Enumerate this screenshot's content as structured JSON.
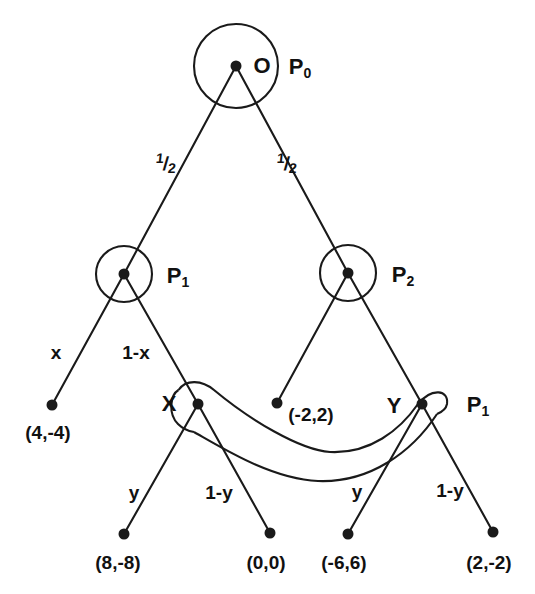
{
  "diagram": {
    "background": "#ffffff",
    "ink": "#1a1a1a",
    "width": 535,
    "height": 594
  },
  "nodes": {
    "root": {
      "label": "O",
      "player": "P",
      "player_sub": "0",
      "x": 236,
      "y": 66,
      "ring_r": 42
    },
    "p1_left": {
      "label": "",
      "player": "P",
      "player_sub": "1",
      "x": 124,
      "y": 274,
      "ring_r": 28
    },
    "p2_right": {
      "label": "",
      "player": "P",
      "player_sub": "2",
      "x": 348,
      "y": 273,
      "ring_r": 28
    },
    "x_node": {
      "label": "X",
      "player": "",
      "player_sub": "",
      "x": 198,
      "y": 404,
      "ring_r": 21
    },
    "y_node": {
      "label": "Y",
      "player": "P",
      "player_sub": "1",
      "x": 422,
      "y": 404,
      "ring_r": 21
    }
  },
  "leaves": [
    {
      "name": "leaf-4-minus4",
      "payoff": "(4,-4)",
      "x": 52,
      "y": 405,
      "label_x": 48,
      "label_y": 432
    },
    {
      "name": "leaf-minus2-2",
      "payoff": "(-2,2)",
      "x": 277,
      "y": 403,
      "label_x": 311,
      "label_y": 414
    },
    {
      "name": "leaf-8-minus8",
      "payoff": "(8,-8)",
      "x": 124,
      "y": 534,
      "label_x": 118,
      "label_y": 562
    },
    {
      "name": "leaf-0-0",
      "payoff": "(0,0)",
      "x": 270,
      "y": 533,
      "label_x": 266,
      "label_y": 562
    },
    {
      "name": "leaf-minus6-6",
      "payoff": "(-6,6)",
      "x": 348,
      "y": 534,
      "label_x": 344,
      "label_y": 562
    },
    {
      "name": "leaf-2-minus2",
      "payoff": "(2,-2)",
      "x": 493,
      "y": 532,
      "label_x": 489,
      "label_y": 562
    }
  ],
  "edge_labels": {
    "root_left": {
      "text": "1/2",
      "num": "1",
      "bar": "/",
      "den": "2",
      "x": 166,
      "y": 163
    },
    "root_right": {
      "text": "1/2",
      "num": "1",
      "bar": "/",
      "den": "2",
      "x": 287,
      "y": 163
    },
    "p1_left_branch": {
      "text": "x",
      "x": 56,
      "y": 352
    },
    "p1_right_branch": {
      "text": "1-x",
      "x": 136,
      "y": 352
    },
    "x_left_branch": {
      "text": "y",
      "x": 134,
      "y": 492
    },
    "x_right_branch": {
      "text": "1-y",
      "x": 219,
      "y": 492
    },
    "y_left_branch": {
      "text": "y",
      "x": 357,
      "y": 491
    },
    "y_right_branch": {
      "text": "1-y",
      "x": 450,
      "y": 490
    }
  },
  "player_labels": {
    "root": {
      "base": "P",
      "sub": "0",
      "x": 300,
      "y": 68
    },
    "p1": {
      "base": "P",
      "sub": "1",
      "x": 178,
      "y": 277
    },
    "p2": {
      "base": "P",
      "sub": "2",
      "x": 403,
      "y": 276
    },
    "y_p1": {
      "base": "P",
      "sub": "1",
      "x": 478,
      "y": 406
    }
  },
  "node_name_labels": {
    "x_node": {
      "text": "X",
      "x": 169,
      "y": 404
    },
    "y_node": {
      "text": "Y",
      "x": 394,
      "y": 406
    }
  },
  "information_set": {
    "name": "infoset-X-Y",
    "description": "elongated oval linking node X and node Y",
    "from_node": "X",
    "to_node": "Y"
  }
}
